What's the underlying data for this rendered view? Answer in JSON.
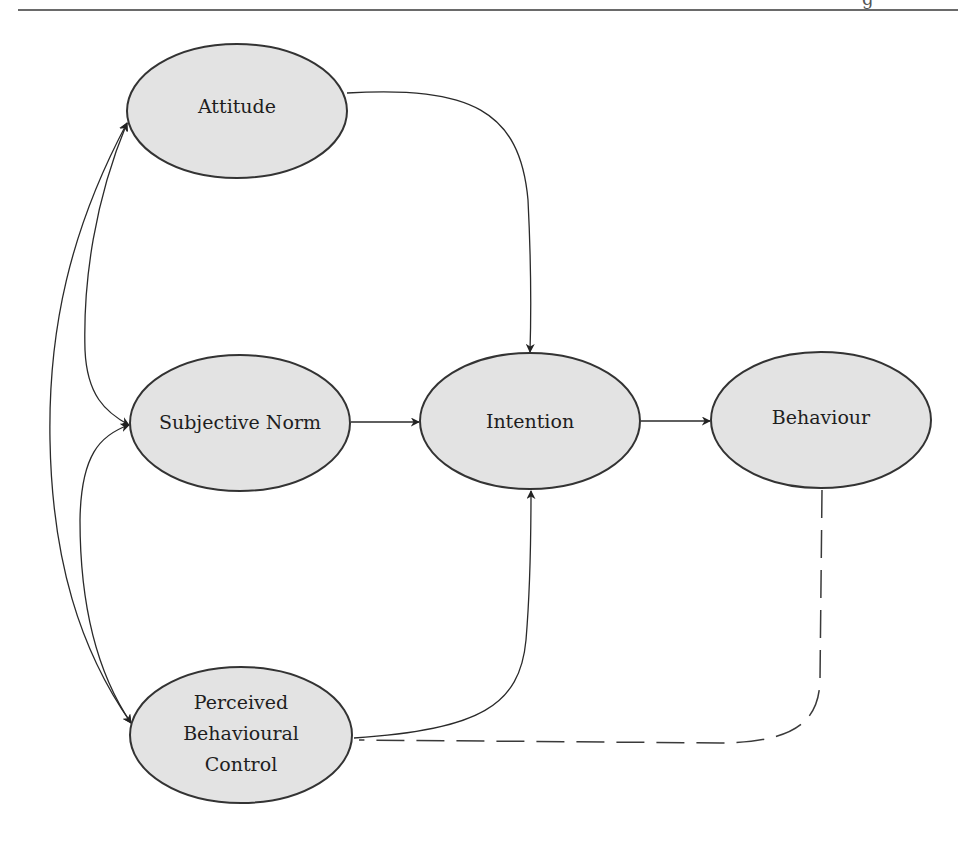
{
  "header": {
    "rule": true,
    "clipped_text_fragment": "g"
  },
  "diagram": {
    "title": "",
    "colors": {
      "node_fill": "#e3e3e3",
      "node_stroke": "#333333",
      "edge": "#2a2a2a",
      "background": "#ffffff"
    },
    "nodes": [
      {
        "id": "attitude",
        "label": "Attitude",
        "lines": [
          "Attitude"
        ]
      },
      {
        "id": "subjective_norm",
        "label": "Subjective Norm",
        "lines": [
          "Subjective Norm"
        ]
      },
      {
        "id": "intention",
        "label": "Intention",
        "lines": [
          "Intention"
        ]
      },
      {
        "id": "behaviour",
        "label": "Behaviour",
        "lines": [
          "Behaviour"
        ]
      },
      {
        "id": "pbc",
        "label": "Perceived Behavioural Control",
        "lines": [
          "Perceived",
          "Behavioural",
          "Control"
        ]
      }
    ],
    "edges": [
      {
        "from": "attitude",
        "to": "intention",
        "style": "solid",
        "arrow": true
      },
      {
        "from": "subjective_norm",
        "to": "intention",
        "style": "solid",
        "arrow": true
      },
      {
        "from": "pbc",
        "to": "intention",
        "style": "solid",
        "arrow": true
      },
      {
        "from": "intention",
        "to": "behaviour",
        "style": "solid",
        "arrow": true
      },
      {
        "from": "behaviour",
        "to": "pbc",
        "style": "dashed",
        "arrow": false
      },
      {
        "from": "subjective_norm",
        "to": "attitude",
        "style": "solid",
        "arrow": true,
        "note": "correlation"
      },
      {
        "from": "attitude",
        "to": "subjective_norm",
        "style": "solid",
        "arrow": true,
        "note": "correlation"
      },
      {
        "from": "subjective_norm",
        "to": "pbc",
        "style": "solid",
        "arrow": true,
        "note": "correlation"
      },
      {
        "from": "pbc",
        "to": "subjective_norm",
        "style": "solid",
        "arrow": true,
        "note": "correlation"
      },
      {
        "from": "attitude",
        "to": "pbc",
        "style": "solid",
        "arrow": true,
        "note": "correlation"
      },
      {
        "from": "pbc",
        "to": "attitude",
        "style": "solid",
        "arrow": true,
        "note": "correlation"
      }
    ]
  }
}
